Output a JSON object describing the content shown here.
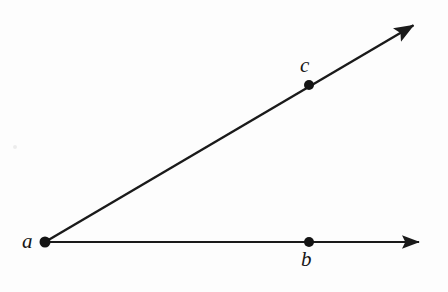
{
  "figure": {
    "type": "geometry-diagram",
    "background_color": "#fdfdfd",
    "stroke_color": "#1a1a1a",
    "width": 448,
    "height": 292
  },
  "labels": {
    "vertex": "a",
    "point_on_horizontal_ray": "b",
    "point_on_diagonal_ray": "c"
  },
  "points": [
    {
      "name": "a",
      "label": "a",
      "x": 45,
      "y": 242,
      "role": "vertex",
      "dot_radius": 5.5
    },
    {
      "name": "b",
      "label": "b",
      "x": 309,
      "y": 242,
      "role": "ray-point",
      "dot_radius": 5.0
    },
    {
      "name": "c",
      "label": "c",
      "x": 309,
      "y": 85,
      "role": "ray-point",
      "dot_radius": 5.0
    }
  ],
  "rays": [
    {
      "name": "ray-ab",
      "from": "a",
      "through": "b",
      "start": {
        "x": 45,
        "y": 242
      },
      "tip": {
        "x": 424,
        "y": 242
      },
      "arrowhead": "end",
      "stroke_width": 2.2
    },
    {
      "name": "ray-ac",
      "from": "a",
      "through": "c",
      "start": {
        "x": 45,
        "y": 242
      },
      "tip": {
        "x": 418,
        "y": 22
      },
      "arrowhead": "end",
      "stroke_width": 2.4
    }
  ],
  "label_positions": {
    "a": {
      "x": 22,
      "y": 231,
      "anchor": "left-of-vertex"
    },
    "b": {
      "x": 301,
      "y": 249,
      "anchor": "below-point"
    },
    "c": {
      "x": 300,
      "y": 55,
      "anchor": "above-point"
    }
  },
  "artifacts": [
    {
      "name": "scan-speck",
      "x": 13,
      "y": 145,
      "size": 4,
      "color": "#ececec"
    }
  ]
}
